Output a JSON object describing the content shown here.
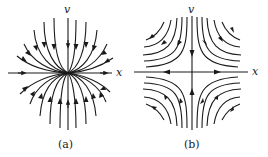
{
  "figure": {
    "panels": [
      {
        "id": "a",
        "caption": "(a)",
        "axis_labels": {
          "horizontal": "x",
          "vertical": "v"
        },
        "description": "Phase portrait: trajectories tangent to x-axis at origin, flowing left to right through the origin"
      },
      {
        "id": "b",
        "caption": "(b)",
        "axis_labels": {
          "horizontal": "x",
          "vertical": "v"
        },
        "description": "Phase portrait: saddle point at origin, inflow along v-axis, outflow along x-axis"
      }
    ],
    "colors": {
      "stroke": "#1a1a1a",
      "background": "#ffffff"
    }
  }
}
